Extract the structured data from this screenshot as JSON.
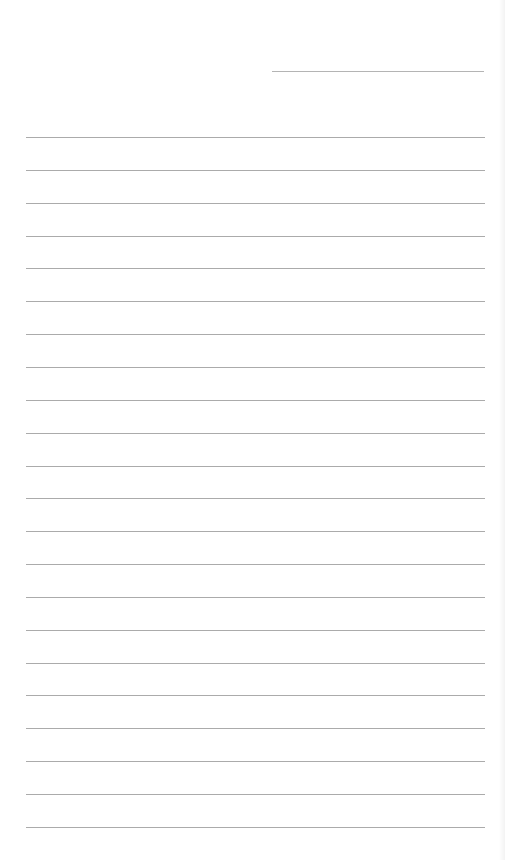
{
  "page": {
    "background": "#ffffff",
    "line_color": "#ababab"
  },
  "header": {
    "field_value": "",
    "line_top": 71,
    "line_left": 272,
    "line_width": 212
  },
  "rules": {
    "left": 26,
    "width": 459,
    "first_top": 137,
    "spacing": 32.85,
    "lines": [
      {
        "text": ""
      },
      {
        "text": ""
      },
      {
        "text": ""
      },
      {
        "text": ""
      },
      {
        "text": ""
      },
      {
        "text": ""
      },
      {
        "text": ""
      },
      {
        "text": ""
      },
      {
        "text": ""
      },
      {
        "text": ""
      },
      {
        "text": ""
      },
      {
        "text": ""
      },
      {
        "text": ""
      },
      {
        "text": ""
      },
      {
        "text": ""
      },
      {
        "text": ""
      },
      {
        "text": ""
      },
      {
        "text": ""
      },
      {
        "text": ""
      },
      {
        "text": ""
      },
      {
        "text": ""
      },
      {
        "text": ""
      }
    ]
  }
}
